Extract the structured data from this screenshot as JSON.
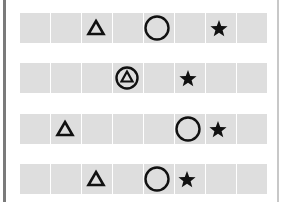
{
  "puzzle": {
    "cells_per_row": 8,
    "colors": {
      "cell": "#dedede",
      "symbol": "#111111",
      "left_border": "#7a7a7a",
      "right_border": "#c8c8c8"
    },
    "rows": [
      {
        "symbols": [
          {
            "type": "triangle",
            "x": 96
          },
          {
            "type": "circle",
            "x": 157
          },
          {
            "type": "star",
            "x": 219
          }
        ]
      },
      {
        "symbols": [
          {
            "type": "circled-triangle",
            "x": 127
          },
          {
            "type": "star",
            "x": 188
          }
        ]
      },
      {
        "symbols": [
          {
            "type": "triangle",
            "x": 65
          },
          {
            "type": "circle",
            "x": 188
          },
          {
            "type": "star",
            "x": 218
          }
        ]
      },
      {
        "symbols": [
          {
            "type": "triangle",
            "x": 96
          },
          {
            "type": "circle",
            "x": 157
          },
          {
            "type": "star",
            "x": 187
          }
        ]
      }
    ]
  }
}
